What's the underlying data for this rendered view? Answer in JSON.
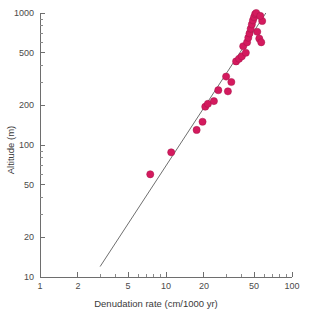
{
  "figure": {
    "background": "#ffffff",
    "point_color": "#d41a5e",
    "line_color": "#6f6f6f",
    "axis_color": "#6e6e6e"
  },
  "chart_data": {
    "type": "scatter",
    "title": "",
    "subtitle": "",
    "xlabel": "Denudation rate (cm/1000 yr)",
    "ylabel": "Altitude (m)",
    "xscale": "log",
    "yscale": "log",
    "xlim": [
      1,
      100
    ],
    "ylim": [
      10,
      1000
    ],
    "grid": false,
    "legend": null,
    "xticks": [
      1,
      2,
      5,
      10,
      20,
      50,
      100
    ],
    "xtick_labels": [
      "1",
      "2",
      "5",
      "10",
      "20",
      "50",
      "100"
    ],
    "yticks": [
      10,
      20,
      50,
      100,
      200,
      500,
      1000
    ],
    "ytick_labels": [
      "10",
      "20",
      "50",
      "100",
      "200",
      "500",
      "1000"
    ],
    "series": [
      {
        "name": "Denudation rate vs altitude",
        "marker": "circle",
        "color": "#d41a5e",
        "points": [
          {
            "x": 7.5,
            "y": 60
          },
          {
            "x": 11.0,
            "y": 88
          },
          {
            "x": 17.5,
            "y": 130
          },
          {
            "x": 19.5,
            "y": 150
          },
          {
            "x": 20.5,
            "y": 195
          },
          {
            "x": 21.5,
            "y": 205
          },
          {
            "x": 24.0,
            "y": 215
          },
          {
            "x": 26.0,
            "y": 260
          },
          {
            "x": 30.0,
            "y": 330
          },
          {
            "x": 31.0,
            "y": 255
          },
          {
            "x": 33.0,
            "y": 300
          },
          {
            "x": 36.0,
            "y": 430
          },
          {
            "x": 38.0,
            "y": 450
          },
          {
            "x": 40.0,
            "y": 470
          },
          {
            "x": 41.0,
            "y": 560
          },
          {
            "x": 43.0,
            "y": 500
          },
          {
            "x": 44.0,
            "y": 600
          },
          {
            "x": 45.0,
            "y": 650
          },
          {
            "x": 46.0,
            "y": 700
          },
          {
            "x": 47.0,
            "y": 760
          },
          {
            "x": 48.0,
            "y": 820
          },
          {
            "x": 49.0,
            "y": 880
          },
          {
            "x": 50.0,
            "y": 930
          },
          {
            "x": 51.0,
            "y": 980
          },
          {
            "x": 52.0,
            "y": 1000
          },
          {
            "x": 53.0,
            "y": 720
          },
          {
            "x": 55.0,
            "y": 640
          },
          {
            "x": 57.0,
            "y": 600
          },
          {
            "x": 58.0,
            "y": 870
          },
          {
            "x": 56.0,
            "y": 950
          }
        ]
      }
    ],
    "trend_line": {
      "name": "fit-line",
      "color": "#6f6f6f",
      "x_start": 3.0,
      "y_start": 12,
      "x_end": 62.0,
      "y_end": 1000
    }
  }
}
